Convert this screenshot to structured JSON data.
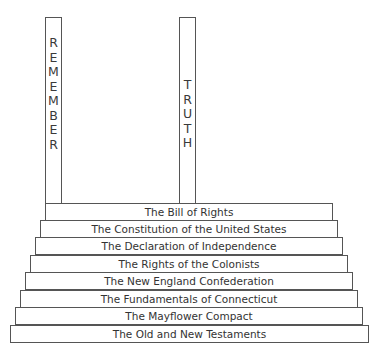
{
  "pillars": {
    "left": {
      "label": "REMEMBER",
      "letters": [
        "R",
        "E",
        "M",
        "E",
        "M",
        "B",
        "E",
        "R"
      ]
    },
    "right": {
      "label": "TRUTH",
      "letters": [
        "T",
        "R",
        "U",
        "T",
        "H"
      ]
    }
  },
  "steps": [
    {
      "label": "The Bill of Rights"
    },
    {
      "label": "The Constitution of the United States"
    },
    {
      "label": "The Declaration of Independence"
    },
    {
      "label": "The Rights of the Colonists"
    },
    {
      "label": "The New England Confederation"
    },
    {
      "label": "The Fundamentals of Connecticut"
    },
    {
      "label": "The Mayflower Compact"
    },
    {
      "label": "The Old and New Testaments"
    }
  ]
}
